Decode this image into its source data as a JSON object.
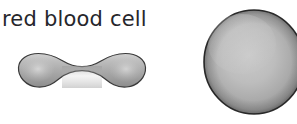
{
  "figure": {
    "background_color": "#ffffff",
    "label": {
      "text": "red blood cell",
      "color": "#26262b",
      "font_size_px": 21
    },
    "shapes": [
      {
        "name": "side-view-cell",
        "description": "biconcave disc seen edge-on, dumbbell silhouette",
        "fill_light": "#c9c9c9",
        "fill_mid": "#a9a9a9",
        "fill_dark": "#8e8e8e",
        "outline_color": "#3a3a3a",
        "outline_width_px": 1.2
      },
      {
        "name": "top-view-cell",
        "description": "biconcave disc seen face-on, rounded disc cropped at right edge",
        "fill_light": "#c6c6c6",
        "fill_mid": "#ababab",
        "fill_dark": "#8a8a8a",
        "outline_color": "#2e2e2e",
        "outline_width_px": 1.5
      }
    ]
  }
}
